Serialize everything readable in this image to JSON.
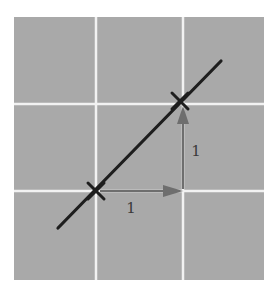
{
  "diagram": {
    "background_color": "#a9a9a9",
    "grid_line_color": "#f2f2f2",
    "line_color": "#1e1e1e",
    "arrow_color": "#6e6e6e",
    "grid": {
      "vertical_lines_x": [
        96,
        183
      ],
      "horizontal_lines_y": [
        104,
        191
      ]
    },
    "line": {
      "from": [
        58,
        228
      ],
      "to": [
        221,
        61
      ]
    },
    "points": [
      {
        "name": "point-a",
        "x": 96,
        "y": 191
      },
      {
        "name": "point-b",
        "x": 180,
        "y": 101
      }
    ],
    "run_arrow": {
      "label": "1",
      "from": [
        96,
        191
      ],
      "to": [
        183,
        191
      ]
    },
    "rise_arrow": {
      "label": "1",
      "from": [
        183,
        191
      ],
      "to": [
        183,
        104
      ]
    }
  }
}
